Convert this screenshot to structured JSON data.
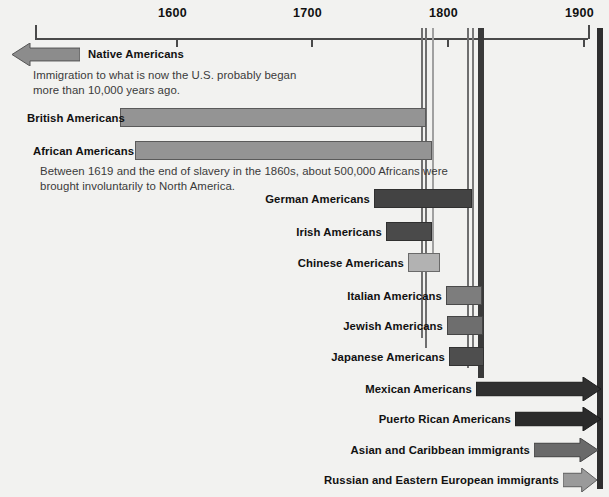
{
  "chart_data": {
    "type": "bar",
    "orientation": "horizontal",
    "xlabel": "",
    "ylabel": "",
    "xlim": [
      1500,
      2010
    ],
    "grid": false,
    "legend": "none",
    "axis": {
      "ticks": [
        {
          "label": "1600",
          "value": 1600
        },
        {
          "label": "1700",
          "value": 1700
        },
        {
          "label": "1800",
          "value": 1800
        },
        {
          "label": "1900",
          "value": 1900
        },
        {
          "label": "2000",
          "value": 2000
        }
      ],
      "tick_px": [
        {
          "label": "1600",
          "x": 176
        },
        {
          "label": "1700",
          "x": 311
        },
        {
          "label": "1800",
          "x": 447
        },
        {
          "label": "1900",
          "x": 583
        },
        {
          "label": "2000",
          "x": 718
        }
      ]
    },
    "categories": [
      "Native Americans",
      "British Americans",
      "African Americans",
      "German Americans",
      "Irish Americans",
      "Chinese Americans",
      "Italian Americans",
      "Jewish Americans",
      "Japanese Americans",
      "Mexican Americans",
      "Puerto Rican Americans",
      "Asian and Caribbean immigrants",
      "Russian and Eastern European immigrants"
    ],
    "bars": [
      {
        "label": "Native Americans",
        "shape": "arrow-left",
        "start_px": 12,
        "end_px": 80,
        "row_y": 43,
        "height": 23,
        "fill": "#8c8c8c",
        "stroke": "#555555",
        "label_x": 88,
        "label_y": 48,
        "label_align": "left",
        "note": "Immigration to what is now the U.S. probably began\nmore than 10,000 years ago.",
        "note_x": 33,
        "note_y": 68,
        "era": "before 1500"
      },
      {
        "label": "British Americans",
        "shape": "rect",
        "start_px": 120,
        "end_px": 426,
        "row_y": 108,
        "height": 19,
        "fill": "#949494",
        "stroke": "#5a5a5a",
        "label_x": 27,
        "label_y": 112,
        "label_align": "left",
        "start_year": 1600,
        "end_year": 1875
      },
      {
        "label": "African Americans",
        "shape": "rect",
        "start_px": 135,
        "end_px": 432,
        "row_y": 141,
        "height": 19,
        "fill": "#949494",
        "stroke": "#5a5a5a",
        "label_x": 33,
        "label_y": 145,
        "label_align": "left",
        "note": "Between 1619 and the end of slavery in the 1860s, about 500,000 Africans were\nbrought involuntarily to North America.",
        "note_x": 40,
        "note_y": 164,
        "start_year": 1619,
        "end_year": 1880
      },
      {
        "label": "German Americans",
        "shape": "rect",
        "start_px": 374,
        "end_px": 472,
        "row_y": 189,
        "height": 19,
        "fill": "#434343",
        "stroke": "#303030",
        "label_x": 370,
        "label_y": 193,
        "label_align": "right",
        "start_year": 1745,
        "end_year": 1918
      },
      {
        "label": "Irish Americans",
        "shape": "rect",
        "start_px": 386,
        "end_px": 432,
        "row_y": 222,
        "height": 19,
        "fill": "#4a4a4a",
        "stroke": "#303030",
        "label_x": 382,
        "label_y": 226,
        "label_align": "right",
        "start_year": 1790,
        "end_year": 1880
      },
      {
        "label": "Chinese Americans",
        "shape": "rect",
        "start_px": 408,
        "end_px": 440,
        "row_y": 253,
        "height": 19,
        "fill": "#b2b2b2",
        "stroke": "#6a6a6a",
        "label_x": 404,
        "label_y": 257,
        "label_align": "right",
        "start_year": 1845,
        "end_year": 1890
      },
      {
        "label": "Italian Americans",
        "shape": "rect",
        "start_px": 446,
        "end_px": 482,
        "row_y": 286,
        "height": 19,
        "fill": "#7d7d7d",
        "stroke": "#4a4a4a",
        "label_x": 442,
        "label_y": 290,
        "label_align": "right",
        "start_year": 1875,
        "end_year": 1925
      },
      {
        "label": "Jewish Americans",
        "shape": "rect",
        "start_px": 447,
        "end_px": 483,
        "row_y": 316,
        "height": 19,
        "fill": "#6e6e6e",
        "stroke": "#454545",
        "label_x": 443,
        "label_y": 320,
        "label_align": "right",
        "start_year": 1880,
        "end_year": 1928
      },
      {
        "label": "Japanese Americans",
        "shape": "rect",
        "start_px": 449,
        "end_px": 484,
        "row_y": 347,
        "height": 19,
        "fill": "#4e4e4e",
        "stroke": "#333333",
        "label_x": 445,
        "label_y": 351,
        "label_align": "right",
        "start_year": 1885,
        "end_year": 1930
      },
      {
        "label": "Mexican Americans",
        "shape": "arrow-right",
        "start_px": 476,
        "end_px": 601,
        "row_y": 377,
        "height": 24,
        "fill": "#303030",
        "stroke": "#1c1c1c",
        "label_x": 472,
        "label_y": 383,
        "label_align": "right",
        "start_year": 1905,
        "end_year": 2000
      },
      {
        "label": "Puerto Rican Americans",
        "shape": "arrow-right",
        "start_px": 515,
        "end_px": 601,
        "row_y": 407,
        "height": 24,
        "fill": "#2b2b2b",
        "stroke": "#1a1a1a",
        "label_x": 511,
        "label_y": 413,
        "label_align": "right",
        "start_year": 1935,
        "end_year": 2000
      },
      {
        "label": "Asian and Caribbean immigrants",
        "shape": "arrow-right",
        "start_px": 534,
        "end_px": 598,
        "row_y": 438,
        "height": 24,
        "fill": "#6a6a6a",
        "stroke": "#434343",
        "label_x": 530,
        "label_y": 444,
        "label_align": "right",
        "start_year": 1950,
        "end_year": 2000
      },
      {
        "label": "Russian and Eastern European immigrants",
        "shape": "arrow-right",
        "start_px": 563,
        "end_px": 597,
        "row_y": 468,
        "height": 24,
        "fill": "#9a9a9a",
        "stroke": "#5e5e5e",
        "label_x": 559,
        "label_y": 474,
        "label_align": "right",
        "start_year": 1975,
        "end_year": 2000
      }
    ],
    "vertical_markers": [
      {
        "x": 421,
        "width": 2,
        "color": "#6f6f6f",
        "height": 310
      },
      {
        "x": 425,
        "width": 2,
        "color": "#6f6f6f",
        "height": 320
      },
      {
        "x": 432,
        "width": 2,
        "color": "#a0a0a0",
        "height": 225
      },
      {
        "x": 467,
        "width": 2,
        "color": "#6f6f6f",
        "height": 340
      },
      {
        "x": 472,
        "width": 2,
        "color": "#7a7a7a",
        "height": 330
      },
      {
        "x": 478,
        "width": 6,
        "color": "#3a3a3a",
        "height": 350
      },
      {
        "x": 597,
        "width": 6,
        "color": "#2e2e2e",
        "height": 461
      }
    ],
    "colors": {
      "background": "#f2f2f0",
      "axis": "#4a4a4a",
      "text": "#111111",
      "note_text": "#3a3a3a",
      "light_bar": "#b2b2b2",
      "medium_bar": "#949494",
      "dark_bar": "#434343",
      "arrow_dark": "#303030"
    }
  }
}
